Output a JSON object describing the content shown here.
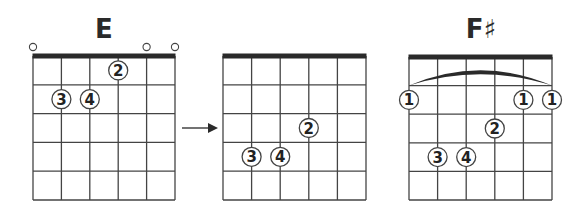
{
  "colors": {
    "line": "#444444",
    "nut": "#2a2a2a",
    "dot_fill": "#ffffff",
    "text": "#222222"
  },
  "diagrams": [
    {
      "title": "E",
      "x": 33,
      "y": 56,
      "string_gap": 28.4,
      "fret_gap": 28.8,
      "frets": 5,
      "strings": 6,
      "open_strings": [
        0,
        4,
        5
      ],
      "barre": null,
      "fingers": [
        {
          "string": 3,
          "fret": 1,
          "label": "2"
        },
        {
          "string": 1,
          "fret": 2,
          "label": "3"
        },
        {
          "string": 2,
          "fret": 2,
          "label": "4"
        }
      ]
    },
    {
      "title": "",
      "x": 223,
      "y": 56,
      "string_gap": 28.6,
      "fret_gap": 28.8,
      "frets": 5,
      "strings": 6,
      "open_strings": [],
      "barre": null,
      "fingers": [
        {
          "string": 3,
          "fret": 3,
          "label": "2"
        },
        {
          "string": 1,
          "fret": 4,
          "label": "3"
        },
        {
          "string": 2,
          "fret": 4,
          "label": "4"
        }
      ]
    },
    {
      "title": "F♯",
      "x": 409,
      "y": 57,
      "string_gap": 28.6,
      "fret_gap": 28.6,
      "frets": 5,
      "strings": 6,
      "open_strings": [],
      "barre": {
        "from_string": 0,
        "to_string": 5
      },
      "fingers": [
        {
          "string": 0,
          "fret": 2,
          "label": "1"
        },
        {
          "string": 4,
          "fret": 2,
          "label": "1"
        },
        {
          "string": 5,
          "fret": 2,
          "label": "1"
        },
        {
          "string": 3,
          "fret": 3,
          "label": "2"
        },
        {
          "string": 1,
          "fret": 4,
          "label": "3"
        },
        {
          "string": 2,
          "fret": 4,
          "label": "4"
        }
      ]
    }
  ],
  "arrow": {
    "x1": 182,
    "x2": 218,
    "y": 128
  },
  "titles": {
    "left": "E",
    "right": "F♯"
  }
}
